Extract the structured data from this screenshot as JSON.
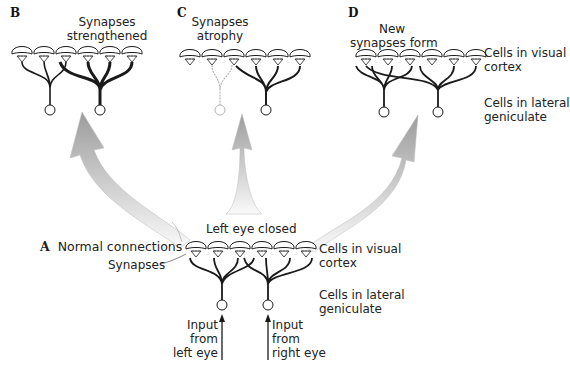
{
  "panels": {
    "A": {
      "letter": "A",
      "title": "Normal connections",
      "synapse_label": "Synapses"
    },
    "B": {
      "letter": "B",
      "caption_line1": "Synapses",
      "caption_line2": "strengthened"
    },
    "C": {
      "letter": "C",
      "caption_line1": "Synapses",
      "caption_line2": "atrophy"
    },
    "D": {
      "letter": "D",
      "caption_line1": "New",
      "caption_line2": "synapses form"
    }
  },
  "layer_labels": {
    "top_cortex_line1": "Cells in visual",
    "top_cortex_line2": "cortex",
    "top_lgn_line1": "Cells in lateral",
    "top_lgn_line2": "geniculate",
    "bottom_cortex_line1": "Cells in visual",
    "bottom_cortex_line2": "cortex",
    "bottom_lgn_line1": "Cells in lateral",
    "bottom_lgn_line2": "geniculate"
  },
  "condition_label": "Left eye closed",
  "inputs": {
    "left_line1": "Input",
    "left_line2": "from",
    "left_line3": "left eye",
    "right_line1": "Input",
    "right_line2": "from",
    "right_line3": "right eye"
  },
  "colors": {
    "ink": "#1a1a1a",
    "faded": "#b5b5b5",
    "arrow_fill_light": "#f2f2f2",
    "arrow_fill_dark": "#9a9a9a"
  }
}
